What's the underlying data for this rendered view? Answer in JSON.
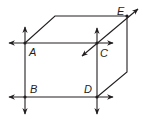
{
  "diagram": {
    "type": "cube-with-lines",
    "colors": {
      "stroke": "#231f20",
      "background": "#ffffff"
    },
    "points": [
      {
        "label": "A",
        "x": 25,
        "y": 43
      },
      {
        "label": "B",
        "x": 25,
        "y": 97
      },
      {
        "label": "C",
        "x": 97,
        "y": 43
      },
      {
        "label": "D",
        "x": 97,
        "y": 97
      },
      {
        "label": "E",
        "x": 127,
        "y": 16
      }
    ],
    "lines": [
      {
        "name": "line-AC",
        "through": [
          "A",
          "C"
        ]
      },
      {
        "name": "line-BD",
        "through": [
          "B",
          "D"
        ]
      },
      {
        "name": "line-AB",
        "through": [
          "A",
          "B"
        ]
      },
      {
        "name": "line-CD",
        "through": [
          "C",
          "D"
        ]
      },
      {
        "name": "line-CE",
        "through": [
          "C",
          "E"
        ]
      }
    ],
    "labels": {
      "A": "A",
      "B": "B",
      "C": "C",
      "D": "D",
      "E": "E"
    }
  }
}
